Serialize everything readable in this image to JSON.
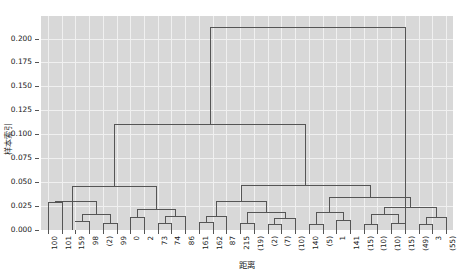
{
  "chart_data": {
    "type": "dendrogram",
    "title": "",
    "xlabel": "距离",
    "ylabel": "样本索引",
    "ylim": [
      0.0,
      0.2235
    ],
    "yticks": [
      "0.000",
      "0.025",
      "0.050",
      "0.075",
      "0.100",
      "0.125",
      "0.150",
      "0.175",
      "0.200"
    ],
    "ytick_values": [
      0.0,
      0.025,
      0.05,
      0.075,
      0.1,
      0.125,
      0.15,
      0.175,
      0.2
    ],
    "grid": true,
    "legend": "none",
    "leaf_labels": [
      "100",
      "101",
      "159",
      "98",
      "(2)",
      "99",
      "0",
      "2",
      "73",
      "74",
      "86",
      "161",
      "162",
      "87",
      "215",
      "(19)",
      "(2)",
      "(7)",
      "(10)",
      "140",
      "(5)",
      "1",
      "141",
      "(15)",
      "(10)",
      "(10)",
      "(15)",
      "(49)",
      "3",
      "(55)"
    ],
    "leaf_count": 30,
    "links": [
      {
        "x1": 0,
        "x2": 1,
        "height": 0.0295,
        "note": "100 + 101"
      },
      {
        "x1": 2,
        "x2": 3,
        "height": 0.0095,
        "note": "159 + 98"
      },
      {
        "x1": 4,
        "x2": 5,
        "height": 0.0075,
        "note": "(2) + 99"
      },
      {
        "x1": 2.5,
        "x2": 4.5,
        "height": 0.0165,
        "note": "merge of above two"
      },
      {
        "x1": 0.5,
        "x2": 3.5,
        "height": 0.0305,
        "note": "left-most group"
      },
      {
        "x1": 6,
        "x2": 7,
        "height": 0.0135,
        "note": "0 + 2"
      },
      {
        "x1": 8,
        "x2": 9,
        "height": 0.0075,
        "note": "73 + 74"
      },
      {
        "x1": 8.5,
        "x2": 10,
        "height": 0.0145,
        "note": "+ 86"
      },
      {
        "x1": 6.5,
        "x2": 9.25,
        "height": 0.0215,
        "note": "group 0-86"
      },
      {
        "x1": 1.75,
        "x2": 7.875,
        "height": 0.0455,
        "note": "left cluster"
      },
      {
        "x1": 11,
        "x2": 12,
        "height": 0.0085,
        "note": "161 + 162"
      },
      {
        "x1": 11.5,
        "x2": 13,
        "height": 0.0145,
        "note": "+ 87"
      },
      {
        "x1": 14,
        "x2": 15,
        "height": 0.0075,
        "note": "215 + (19)"
      },
      {
        "x1": 16,
        "x2": 17,
        "height": 0.0065,
        "note": "(2) + (7)"
      },
      {
        "x1": 16.5,
        "x2": 18,
        "height": 0.0125,
        "note": "+ (10)"
      },
      {
        "x1": 14.5,
        "x2": 17.25,
        "height": 0.0185,
        "note": "group 215-(10)"
      },
      {
        "x1": 12.25,
        "x2": 15.875,
        "height": 0.0305,
        "note": "mid-left cluster"
      },
      {
        "x1": 19,
        "x2": 20,
        "height": 0.0065,
        "note": "140 + (5)"
      },
      {
        "x1": 21,
        "x2": 22,
        "height": 0.0105,
        "note": "1 + 141"
      },
      {
        "x1": 19.5,
        "x2": 21.5,
        "height": 0.0185,
        "note": "group 140-141"
      },
      {
        "x1": 23,
        "x2": 24,
        "height": 0.0065,
        "note": "(15) + (10)"
      },
      {
        "x1": 25,
        "x2": 26,
        "height": 0.0075,
        "note": "(10) + (15)"
      },
      {
        "x1": 23.5,
        "x2": 25.5,
        "height": 0.0165,
        "note": "merge"
      },
      {
        "x1": 27,
        "x2": 28,
        "height": 0.0065,
        "note": "(49) + 3"
      },
      {
        "x1": 27.5,
        "x2": 29,
        "height": 0.0135,
        "note": "+ (55)"
      },
      {
        "x1": 24.5,
        "x2": 28.25,
        "height": 0.0245,
        "note": "right sub-cluster"
      },
      {
        "x1": 20.5,
        "x2": 26.375,
        "height": 0.0345,
        "note": "right cluster"
      },
      {
        "x1": 14.0625,
        "x2": 23.4375,
        "height": 0.0475,
        "note": "right half"
      },
      {
        "x1": 4.8125,
        "x2": 18.75,
        "height": 0.1105,
        "note": "second level merge"
      },
      {
        "x1": 11.78125,
        "x2": 26.0,
        "height": 0.2125,
        "note": "root"
      }
    ],
    "colors": {
      "plot_background": "#d8d8d8",
      "gridline": "#f0f0f0",
      "link": "#555555",
      "text": "#1a1a1a",
      "figure_background": "#ffffff"
    }
  }
}
